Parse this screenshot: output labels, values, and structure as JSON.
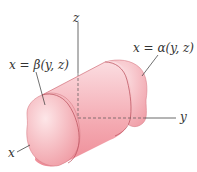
{
  "figure": {
    "labels": {
      "z_axis": "z",
      "y_axis": "y",
      "x_axis": "x",
      "back_surface": "x = α(y, z)",
      "front_surface": "x = β(y, z)"
    },
    "colors": {
      "solid_fill": "#f2a3ab",
      "solid_highlight": "#fbe0e3",
      "solid_edge": "#c95763",
      "axis": "#444444"
    }
  }
}
